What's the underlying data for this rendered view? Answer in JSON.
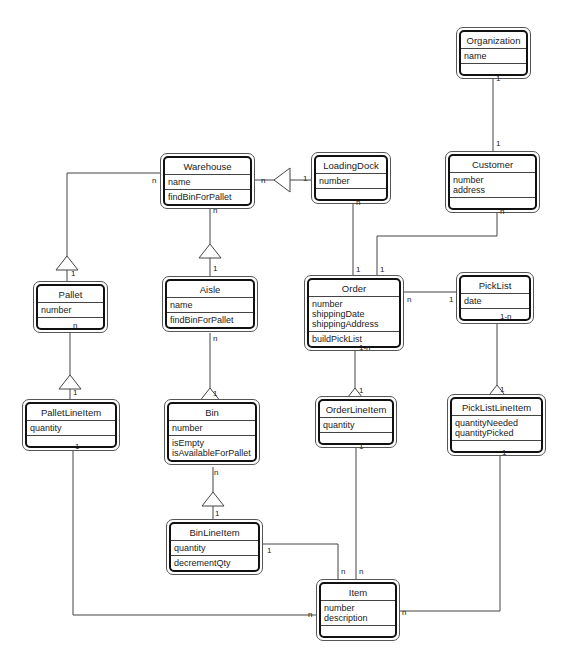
{
  "diagram": {
    "type": "UML class diagram",
    "classes": {
      "organization": {
        "name": "Organization",
        "attributes": [
          "name"
        ],
        "operations": []
      },
      "customer": {
        "name": "Customer",
        "attributes": [
          "number",
          "address"
        ],
        "operations": []
      },
      "warehouse": {
        "name": "Warehouse",
        "attributes": [
          "name"
        ],
        "operations": [
          "findBinForPallet"
        ]
      },
      "loadingdock": {
        "name": "LoadingDock",
        "attributes": [
          "number"
        ],
        "operations": []
      },
      "pallet": {
        "name": "Pallet",
        "attributes": [
          "number"
        ],
        "operations": []
      },
      "aisle": {
        "name": "Aisle",
        "attributes": [
          "name"
        ],
        "operations": [
          "findBinForPallet"
        ]
      },
      "order": {
        "name": "Order",
        "attributes": [
          "number",
          "shippingDate",
          "shippingAddress"
        ],
        "operations": [
          "buildPickList"
        ]
      },
      "picklist": {
        "name": "PickList",
        "attributes": [
          "date"
        ],
        "operations": []
      },
      "palletlineitem": {
        "name": "PalletLineItem",
        "attributes": [
          "quantity"
        ],
        "operations": []
      },
      "bin": {
        "name": "Bin",
        "attributes": [
          "number"
        ],
        "operations": [
          "isEmpty",
          "isAvailableForPallet"
        ]
      },
      "orderlineitem": {
        "name": "OrderLineItem",
        "attributes": [
          "quantity"
        ],
        "operations": []
      },
      "picklistlineitem": {
        "name": "PickListLineItem",
        "attributes": [
          "quantityNeeded",
          "quantityPicked"
        ],
        "operations": []
      },
      "binlineitem": {
        "name": "BinLineItem",
        "attributes": [
          "quantity"
        ],
        "operations": [
          "decrementQty"
        ]
      },
      "item": {
        "name": "Item",
        "attributes": [
          "number",
          "description"
        ],
        "operations": []
      }
    },
    "relationships": [
      {
        "from": "Organization",
        "to": "Customer",
        "from_mult": "1",
        "to_mult": "1",
        "kind": "association"
      },
      {
        "from": "Warehouse",
        "to": "LoadingDock",
        "from_mult": "n",
        "to_mult": "1",
        "kind": "aggregation"
      },
      {
        "from": "Warehouse",
        "to": "Pallet",
        "from_mult": "n",
        "to_mult": "1",
        "kind": "aggregation"
      },
      {
        "from": "Warehouse",
        "to": "Aisle",
        "from_mult": "n",
        "to_mult": "1",
        "kind": "aggregation"
      },
      {
        "from": "LoadingDock",
        "to": "Order",
        "from_mult": "n",
        "to_mult": "1",
        "kind": "association"
      },
      {
        "from": "Customer",
        "to": "Order",
        "from_mult": "n",
        "to_mult": "1",
        "kind": "association"
      },
      {
        "from": "Order",
        "to": "PickList",
        "from_mult": "n",
        "to_mult": "1",
        "kind": "association"
      },
      {
        "from": "Pallet",
        "to": "PalletLineItem",
        "from_mult": "n",
        "to_mult": "1",
        "kind": "aggregation"
      },
      {
        "from": "Aisle",
        "to": "Bin",
        "from_mult": "n",
        "to_mult": "1",
        "kind": "aggregation"
      },
      {
        "from": "Order",
        "to": "OrderLineItem",
        "from_mult": "1-n",
        "to_mult": "1",
        "kind": "aggregation"
      },
      {
        "from": "PickList",
        "to": "PickListLineItem",
        "from_mult": "1-n",
        "to_mult": "1",
        "kind": "aggregation"
      },
      {
        "from": "Bin",
        "to": "BinLineItem",
        "from_mult": "n",
        "to_mult": "1",
        "kind": "aggregation"
      },
      {
        "from": "BinLineItem",
        "to": "Item",
        "from_mult": "1",
        "to_mult": "n",
        "kind": "association"
      },
      {
        "from": "OrderLineItem",
        "to": "Item",
        "from_mult": "1",
        "to_mult": "n",
        "kind": "association"
      },
      {
        "from": "PalletLineItem",
        "to": "Item",
        "from_mult": "1",
        "to_mult": "n",
        "kind": "association"
      },
      {
        "from": "PickListLineItem",
        "to": "Item",
        "from_mult": "1",
        "to_mult": "n",
        "kind": "association"
      }
    ],
    "multiplicity_labels": {
      "m1": "1",
      "n": "n",
      "m1n": "1-n"
    }
  }
}
